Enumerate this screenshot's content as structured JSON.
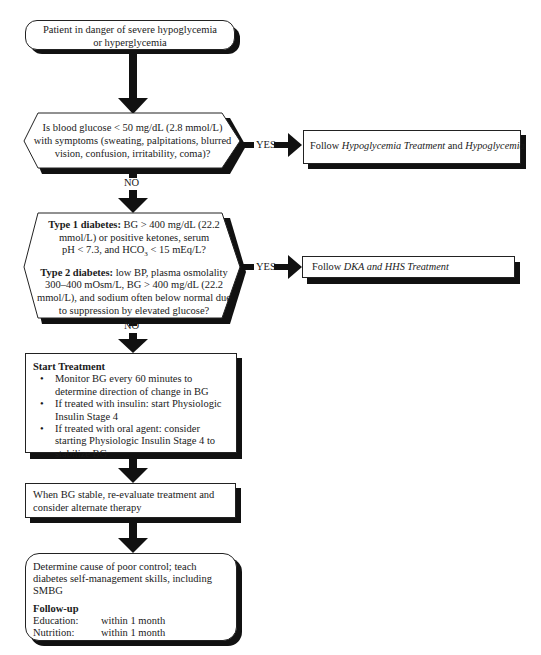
{
  "flowchart": {
    "start": {
      "line1": "Patient in danger of severe hypoglycemia",
      "line2": "or hyperglycemia"
    },
    "decision1": {
      "line1": "Is blood glucose < 50 mg/dL (2.8 mmol/L)",
      "line2": "with symptoms (sweating, palpitations, blurred",
      "line3": "vision, confusion, irritability, coma)?",
      "yes_label": "YES",
      "no_label": "NO"
    },
    "action1": {
      "prefix": "Follow ",
      "italic1": "Hypoglycemia Treatment",
      "middle": " and ",
      "italic2": "Hypoglycemia"
    },
    "decision2": {
      "type1_heading": "Type 1 diabetes:",
      "type1_line1": " BG > 400 mg/dL (22.2",
      "type1_line2": "mmol/L) or positive ketones, serum",
      "type1_line3a": "pH < 7.3, and HCO",
      "type1_sub": "3",
      "type1_line3b": " < 15 mEq/L?",
      "type2_heading": "Type 2 diabetes:",
      "type2_line1": " low BP, plasma osmolality",
      "type2_line2": "300–400 mOsm/L, BG > 400 mg/dL (22.2",
      "type2_line3": "mmol/L), and sodium often below normal due",
      "type2_line4": "to suppression by elevated glucose?",
      "yes_label": "YES",
      "no_label": "NO"
    },
    "action2": {
      "prefix": "Follow ",
      "italic": "DKA and HHS Treatment"
    },
    "treatment": {
      "title": "Start Treatment",
      "bullets": [
        "Monitor BG every 60 minutes to determine direction of change in BG",
        "If treated with insulin: start Physiologic Insulin Stage 4",
        "If treated with oral agent: consider starting Physiologic Insulin Stage 4 to stabilize BG"
      ]
    },
    "reevaluate": {
      "text": "When BG stable, re-evaluate treatment and consider alternate therapy"
    },
    "final": {
      "text": "Determine cause of poor control; teach diabetes self-management skills, including SMBG",
      "followup_title": "Follow-up",
      "rows": [
        {
          "label": "Education:",
          "value": "within 1 month"
        },
        {
          "label": "Nutrition:",
          "value": "within 1 month"
        }
      ]
    }
  }
}
